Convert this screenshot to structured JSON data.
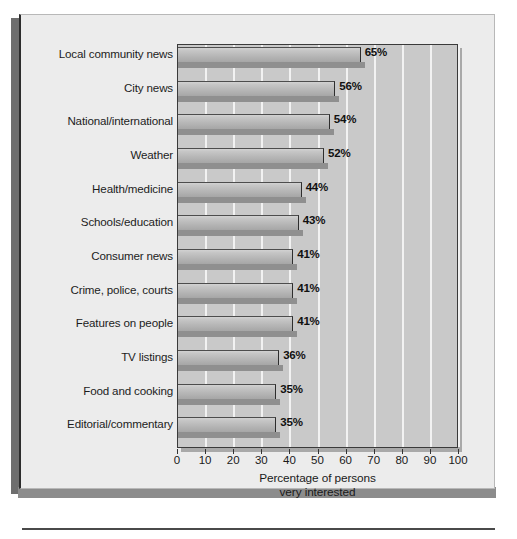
{
  "chart_data": {
    "type": "bar",
    "orientation": "horizontal",
    "title": "",
    "xlabel": "Percentage of persons very interested",
    "ylabel": "",
    "xlim": [
      0,
      100
    ],
    "xticks": [
      0,
      10,
      20,
      30,
      40,
      50,
      60,
      70,
      80,
      90,
      100
    ],
    "grid": true,
    "legend": "none",
    "categories": [
      "Local community news",
      "City news",
      "National/international",
      "Weather",
      "Health/medicine",
      "Schools/education",
      "Consumer news",
      "Crime, police, courts",
      "Features on people",
      "TV listings",
      "Food and cooking",
      "Editorial/commentary"
    ],
    "values": [
      65,
      56,
      54,
      52,
      44,
      43,
      41,
      41,
      41,
      36,
      35,
      35
    ],
    "value_labels": [
      "65%",
      "56%",
      "54%",
      "52%",
      "44%",
      "43%",
      "41%",
      "41%",
      "41%",
      "36%",
      "35%",
      "35%"
    ]
  },
  "axis": {
    "title_line1": "Percentage of persons",
    "title_line2": "very interested"
  },
  "colors": {
    "page_background": "#ffffff",
    "card_background": "#ececec",
    "plot_background": "#c9c9c9",
    "gridline": "#f2f2f2",
    "bar_light": "#d2d2d2",
    "bar_dark": "#a6a6a6",
    "bar_shadow": "#8f8f8f",
    "text": "#1a1a1a",
    "frame": "#2c2c2c"
  }
}
